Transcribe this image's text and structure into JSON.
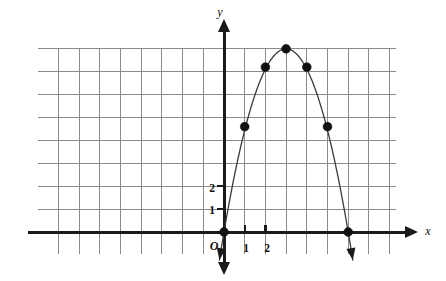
{
  "chart_data": {
    "type": "scatter",
    "title": "",
    "subtitle": "",
    "xlabel": "x",
    "ylabel": "y",
    "origin_label": "O",
    "grid": true,
    "legend": null,
    "xlim": [
      -9.3,
      8.6
    ],
    "ylim": [
      -1.1,
      9.2
    ],
    "x_tick_labels": [
      "1",
      "2"
    ],
    "x_tick_values": [
      1,
      2
    ],
    "y_tick_labels": [
      "1",
      "2"
    ],
    "y_tick_values": [
      1,
      2
    ],
    "curve": {
      "name": "parabola",
      "equation_form": "quadratic",
      "vertex": [
        3,
        8
      ],
      "x_intercepts": [
        0,
        6
      ],
      "points_x": [
        0,
        1,
        2,
        3,
        4,
        5,
        6
      ],
      "points_y": [
        0,
        4.6,
        7.2,
        8,
        7.2,
        4.6,
        0
      ]
    },
    "marked_points": [
      {
        "label": "",
        "x": 0,
        "y": 0
      },
      {
        "label": "",
        "x": 1,
        "y": 4.6
      },
      {
        "label": "",
        "x": 2,
        "y": 7.2
      },
      {
        "label": "",
        "x": 3,
        "y": 8
      },
      {
        "label": "",
        "x": 4,
        "y": 7.2
      },
      {
        "label": "",
        "x": 5,
        "y": 4.6
      },
      {
        "label": "",
        "x": 6,
        "y": 0
      }
    ],
    "grid_columns": 19,
    "grid_rows": 10,
    "colors": {
      "grid": "#8a8a8a",
      "axis": "#1a1a1a",
      "curve": "#3a3a3a",
      "point": "#111111",
      "background": "#ffffff"
    }
  },
  "figure": {
    "axis_x_label": "x",
    "axis_y_label": "y",
    "origin_label": "O",
    "tick_label_x_1": "1",
    "tick_label_x_2": "2",
    "tick_label_y_1": "1",
    "tick_label_y_2": "2"
  }
}
